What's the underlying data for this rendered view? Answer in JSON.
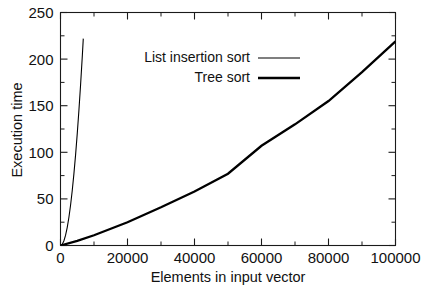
{
  "chart_data": {
    "type": "line",
    "title": "",
    "xlabel": "Elements in input vector",
    "ylabel": "Execution time",
    "xlim": [
      0,
      100000
    ],
    "ylim": [
      0,
      250
    ],
    "grid": false,
    "legend_position": "top-center-right",
    "x_ticks": [
      0,
      20000,
      40000,
      60000,
      80000,
      100000
    ],
    "x_tick_labels": [
      "0",
      "20000",
      "40000",
      "60000",
      "80000",
      "100000"
    ],
    "x_minor_tick_step": 10000,
    "y_ticks": [
      0,
      50,
      100,
      150,
      200,
      250
    ],
    "y_tick_labels": [
      "0",
      "50",
      "100",
      "150",
      "200",
      "250"
    ],
    "y_minor_tick_step": 25,
    "series": [
      {
        "name": "List insertion sort",
        "style": "thin",
        "x": [
          0,
          500,
          1000,
          1500,
          2000,
          2500,
          3000,
          3500,
          4000,
          4500,
          5000,
          5500,
          6000,
          6500,
          6800
        ],
        "values": [
          0,
          1.2,
          4.8,
          10.8,
          19.2,
          30.0,
          43.2,
          58.8,
          76.8,
          97.2,
          120.0,
          145.2,
          172.8,
          202.8,
          222.0
        ]
      },
      {
        "name": "Tree sort",
        "style": "thick",
        "x": [
          0,
          5000,
          10000,
          20000,
          30000,
          40000,
          50000,
          60000,
          70000,
          80000,
          90000,
          100000
        ],
        "values": [
          0,
          5,
          11,
          25,
          41,
          58,
          77,
          107,
          130,
          155,
          186,
          219
        ]
      }
    ]
  },
  "legend": {
    "items": [
      {
        "label": "List insertion sort",
        "style": "thin"
      },
      {
        "label": "Tree sort",
        "style": "thick"
      }
    ]
  }
}
